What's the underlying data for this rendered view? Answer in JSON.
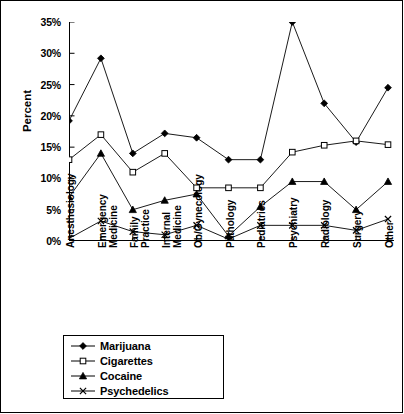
{
  "chart_data": {
    "type": "line",
    "title": "",
    "xlabel": "",
    "ylabel": "Percent",
    "ylim": [
      0,
      35
    ],
    "ytick_step": 5,
    "ytick_labels": [
      "0%",
      "5%",
      "10%",
      "15%",
      "20%",
      "25%",
      "30%",
      "35%"
    ],
    "grid": false,
    "legend_position": "below-chart",
    "categories": [
      "Anesthesiology",
      "Emergency Medicine",
      "Family Practice",
      "Internal Medicine",
      "Ob/Gynecology",
      "Pathology",
      "Pediatrics",
      "Psychiatry",
      "Radiology",
      "Surgery",
      "Other"
    ],
    "series": [
      {
        "name": "Marijuana",
        "marker": "filled-diamond",
        "values": [
          19.2,
          29.2,
          14.0,
          17.2,
          16.5,
          13.0,
          13.0,
          35.0,
          22.0,
          15.8,
          24.5
        ]
      },
      {
        "name": "Cigarettes",
        "marker": "open-square",
        "values": [
          13.0,
          17.0,
          11.0,
          14.0,
          8.5,
          8.5,
          8.5,
          14.2,
          15.3,
          16.0,
          15.4
        ]
      },
      {
        "name": "Cocaine",
        "marker": "filled-triangle",
        "values": [
          7.0,
          14.0,
          5.0,
          6.5,
          7.5,
          0.8,
          5.5,
          9.5,
          9.5,
          5.0,
          9.5
        ]
      },
      {
        "name": "Psychedelics",
        "marker": "cross-x",
        "values": [
          0.4,
          3.2,
          1.5,
          1.0,
          2.5,
          0.3,
          2.5,
          2.5,
          2.5,
          1.7,
          3.5
        ]
      }
    ]
  },
  "legend": {
    "entries": [
      {
        "label": "Marijuana"
      },
      {
        "label": "Cigarettes"
      },
      {
        "label": "Cocaine"
      },
      {
        "label": "Psychedelics"
      }
    ]
  }
}
